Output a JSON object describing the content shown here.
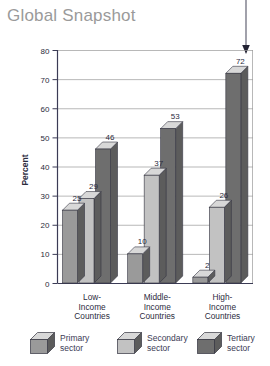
{
  "title": "Global Snapshot",
  "annotation": {
    "arrow_icon": "down-arrow-icon",
    "points_to_value": "72"
  },
  "chart_data": {
    "type": "bar",
    "title": "Global Snapshot",
    "xlabel": "",
    "ylabel": "Percent",
    "ylim": [
      0,
      80
    ],
    "yticks": [
      "0",
      "10",
      "20",
      "30",
      "40",
      "50",
      "60",
      "70",
      "80"
    ],
    "grid": true,
    "legend_position": "bottom",
    "categories": [
      "Low-Income Countries",
      "Middle-Income Countries",
      "High-Income Countries"
    ],
    "category_lines": [
      [
        "Low-",
        "Income",
        "Countries"
      ],
      [
        "Middle-",
        "Income",
        "Countries"
      ],
      [
        "High-",
        "Income",
        "Countries"
      ]
    ],
    "series": [
      {
        "name": "Primary sector",
        "values": [
          25,
          10,
          2
        ],
        "color": "#9a9a9a"
      },
      {
        "name": "Secondary sector",
        "values": [
          29,
          37,
          26
        ],
        "color": "#c2c2c2"
      },
      {
        "name": "Tertiary sector",
        "values": [
          46,
          53,
          72
        ],
        "color": "#6e6e6e"
      }
    ],
    "bar_labels": [
      [
        "25",
        "29",
        "46"
      ],
      [
        "10",
        "37",
        "53"
      ],
      [
        "2",
        "26",
        "72"
      ]
    ]
  },
  "colors": {
    "title": "#9a9a9a",
    "axis": "#3b3b55",
    "grid": "#9a9a9a",
    "primary": "#9a9a9a",
    "secondary": "#c2c2c2",
    "tertiary": "#6e6e6e",
    "top_face": "#d8d8d8",
    "side_face": "#5c5c5c",
    "label_text": "#2b2b3d"
  },
  "legend": [
    {
      "label_line1": "Primary",
      "label_line2": "sector",
      "icon": "cube-icon-primary"
    },
    {
      "label_line1": "Secondary",
      "label_line2": "sector",
      "icon": "cube-icon-secondary"
    },
    {
      "label_line1": "Tertiary",
      "label_line2": "sector",
      "icon": "cube-icon-tertiary"
    }
  ],
  "axis": {
    "y_label": "Percent",
    "y_ticks": [
      "80",
      "70",
      "60",
      "50",
      "40",
      "30",
      "20",
      "10",
      "0"
    ]
  }
}
